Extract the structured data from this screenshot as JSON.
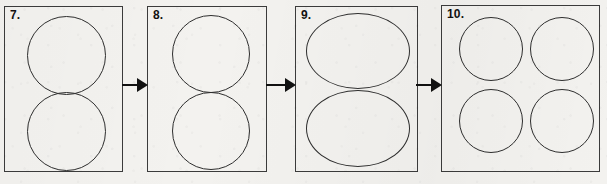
{
  "figure": {
    "type": "sequence-diagram",
    "background_color": "#f3f2ef",
    "ink_color": "#2e2e2e",
    "arrow_color": "#111111"
  },
  "panels": [
    {
      "label": "7.",
      "name": "panel-7",
      "box": {
        "x": 4,
        "y": 6,
        "w": 119,
        "h": 166
      },
      "shapes": [
        {
          "name": "circle-top",
          "kind": "circle",
          "x": 22,
          "y": 9,
          "w": 79,
          "h": 79
        },
        {
          "name": "circle-bottom",
          "kind": "circle",
          "x": 22,
          "y": 85,
          "w": 79,
          "h": 79
        }
      ]
    },
    {
      "label": "8.",
      "name": "panel-8",
      "box": {
        "x": 147,
        "y": 6,
        "w": 120,
        "h": 166
      },
      "shapes": [
        {
          "name": "circle-top",
          "kind": "circle",
          "x": 24,
          "y": 8,
          "w": 78,
          "h": 78
        },
        {
          "name": "circle-bottom",
          "kind": "circle",
          "x": 24,
          "y": 85,
          "w": 78,
          "h": 78
        }
      ]
    },
    {
      "label": "9.",
      "name": "panel-9",
      "box": {
        "x": 295,
        "y": 6,
        "w": 123,
        "h": 166
      },
      "shapes": [
        {
          "name": "ellipse-top",
          "kind": "ellipse",
          "x": 10,
          "y": 6,
          "w": 104,
          "h": 76
        },
        {
          "name": "ellipse-bottom",
          "kind": "ellipse",
          "x": 10,
          "y": 83,
          "w": 104,
          "h": 77
        }
      ]
    },
    {
      "label": "10.",
      "name": "panel-10",
      "box": {
        "x": 441,
        "y": 5,
        "w": 159,
        "h": 167
      },
      "shapes": [
        {
          "name": "circle-top-left",
          "kind": "circle",
          "x": 17,
          "y": 11,
          "w": 64,
          "h": 64
        },
        {
          "name": "circle-top-right",
          "kind": "circle",
          "x": 88,
          "y": 11,
          "w": 64,
          "h": 64
        },
        {
          "name": "circle-bottom-left",
          "kind": "circle",
          "x": 17,
          "y": 83,
          "w": 64,
          "h": 64
        },
        {
          "name": "circle-bottom-right",
          "kind": "circle",
          "x": 88,
          "y": 83,
          "w": 64,
          "h": 64
        }
      ]
    }
  ],
  "arrows": [
    {
      "name": "arrow-7-to-8",
      "x": 122,
      "y": 78,
      "w": 26
    },
    {
      "name": "arrow-8-to-9",
      "x": 266,
      "y": 78,
      "w": 30
    },
    {
      "name": "arrow-9-to-10",
      "x": 416,
      "y": 78,
      "w": 26
    }
  ]
}
